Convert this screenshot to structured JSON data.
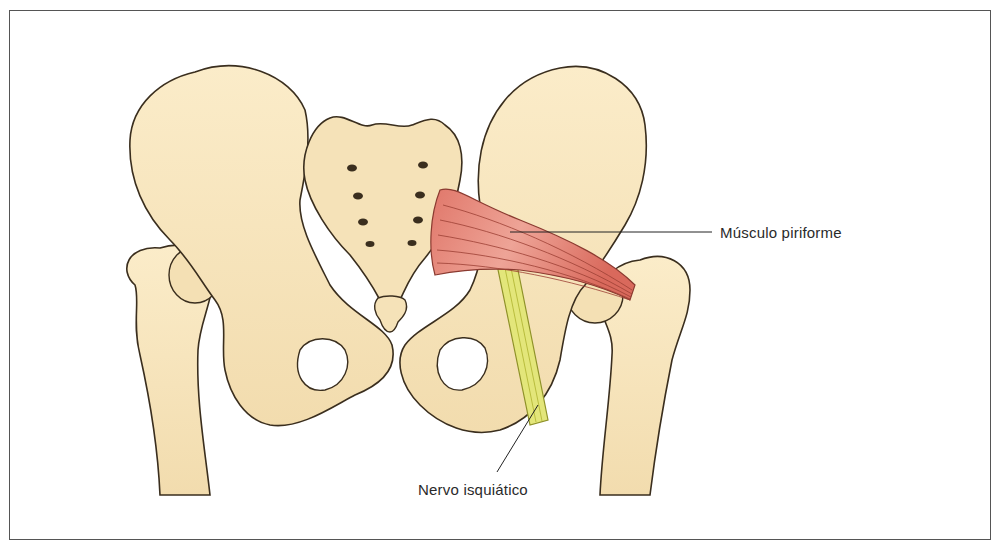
{
  "figure": {
    "labels": {
      "piriformis": "Músculo piriforme",
      "sciatic_nerve": "Nervo isquiático"
    },
    "colors": {
      "bone_fill": "#f6e4bd",
      "bone_shade": "#e8cf98",
      "outline": "#3a2e1e",
      "muscle": "#e0776a",
      "muscle_light": "#f0a79a",
      "nerve": "#e3e67a",
      "nerve_dark": "#b9bd3e",
      "frame": "#555555"
    }
  }
}
